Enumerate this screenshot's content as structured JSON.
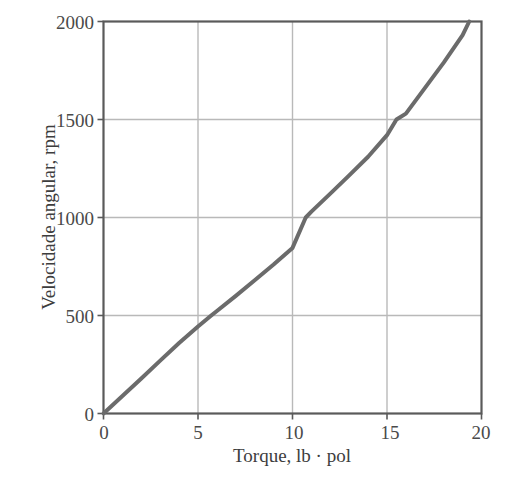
{
  "chart_data": {
    "type": "line",
    "title": "",
    "xlabel": "Torque, lb · pol",
    "ylabel": "Velocidade angular, rpm",
    "xlim": [
      0,
      20
    ],
    "ylim": [
      0,
      2000
    ],
    "xticks": [
      "0",
      "5",
      "10",
      "15",
      "20"
    ],
    "xtick_values": [
      0,
      5,
      10,
      15,
      20
    ],
    "yticks": [
      "0",
      "500",
      "1000",
      "1500",
      "2000"
    ],
    "ytick_values": [
      0,
      500,
      1000,
      1500,
      2000
    ],
    "grid": true,
    "legend": null,
    "series": [
      {
        "name": "Velocidade angular vs Torque",
        "color": "#6b6b6b",
        "linewidth": 4,
        "x": [
          0.0,
          1.0,
          2.0,
          3.0,
          4.0,
          5.0,
          5.7,
          6.0,
          7.0,
          8.0,
          9.0,
          10.0,
          10.7,
          11.0,
          12.0,
          13.0,
          14.0,
          15.0,
          15.5,
          16.0,
          17.0,
          18.0,
          19.0,
          19.35
        ],
        "y": [
          0,
          89,
          179,
          270,
          360,
          444,
          500,
          523,
          600,
          680,
          760,
          845,
          1000,
          1030,
          1122,
          1215,
          1310,
          1420,
          1500,
          1530,
          1660,
          1790,
          1930,
          2000
        ]
      }
    ]
  },
  "axes": {
    "x_title": "Torque, lb · pol",
    "y_title": "Velocidade angular, rpm",
    "x_tick_labels": [
      "0",
      "5",
      "10",
      "15",
      "20"
    ],
    "y_tick_labels": [
      "0",
      "500",
      "1000",
      "1500",
      "2000"
    ]
  },
  "colors": {
    "curve": "#6b6b6b",
    "grid": "#b9b9b9",
    "frame": "#5a5a5a",
    "background": "#ffffff",
    "text": "#3d3d3d"
  }
}
